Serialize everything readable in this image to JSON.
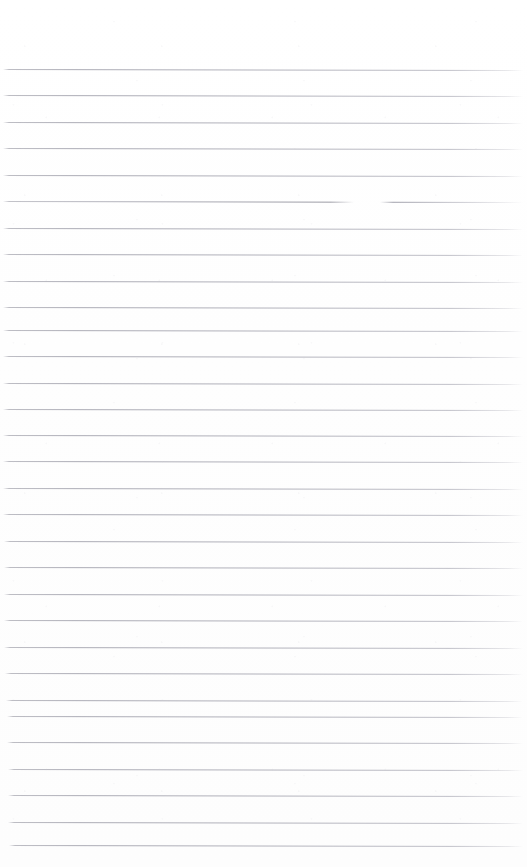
{
  "document": {
    "kind": "scanned-blank-ruled-page",
    "title": "Blank Ruled Notebook Page",
    "page_width": 527,
    "page_height": 867,
    "background_color": "#ffffff",
    "rule_color": "#aaaab4",
    "has_visible_text": false,
    "has_handwriting": false,
    "has_margin_rule": false,
    "top_margin_height": 68,
    "rule_spacing": 26.5,
    "rule_thickness": 1,
    "rule_left_x": 4,
    "rule_right_x": 523,
    "rule_slope_deg": 0.12,
    "rule_count": 30,
    "notes": "Empty lined paper scan: no writing, no headers, no page numbers."
  },
  "rules": [
    {
      "index": 1,
      "y": 69,
      "left": 3,
      "right": 523,
      "gap": false
    },
    {
      "index": 2,
      "y": 95,
      "left": 3,
      "right": 523,
      "gap": false
    },
    {
      "index": 3,
      "y": 122,
      "left": 3,
      "right": 523,
      "gap": false
    },
    {
      "index": 4,
      "y": 148,
      "left": 3,
      "right": 523,
      "gap": false
    },
    {
      "index": 5,
      "y": 175,
      "left": 3,
      "right": 523,
      "gap": false
    },
    {
      "index": 6,
      "y": 201,
      "left": 3,
      "right": 523,
      "gap": true
    },
    {
      "index": 7,
      "y": 228,
      "left": 3,
      "right": 523,
      "gap": false
    },
    {
      "index": 8,
      "y": 254,
      "left": 3,
      "right": 523,
      "gap": false
    },
    {
      "index": 9,
      "y": 281,
      "left": 3,
      "right": 523,
      "gap": false
    },
    {
      "index": 10,
      "y": 307,
      "left": 3,
      "right": 523,
      "gap": false
    },
    {
      "index": 11,
      "y": 330,
      "left": 3,
      "right": 523,
      "gap": false
    },
    {
      "index": 12,
      "y": 356,
      "left": 3,
      "right": 523,
      "gap": false
    },
    {
      "index": 13,
      "y": 383,
      "left": 3,
      "right": 523,
      "gap": false
    },
    {
      "index": 14,
      "y": 409,
      "left": 3,
      "right": 523,
      "gap": false
    },
    {
      "index": 15,
      "y": 435,
      "left": 3,
      "right": 523,
      "gap": false
    },
    {
      "index": 16,
      "y": 461,
      "left": 3,
      "right": 523,
      "gap": false
    },
    {
      "index": 17,
      "y": 488,
      "left": 3,
      "right": 523,
      "gap": false
    },
    {
      "index": 18,
      "y": 514,
      "left": 3,
      "right": 523,
      "gap": false
    },
    {
      "index": 19,
      "y": 541,
      "left": 4,
      "right": 523,
      "gap": false
    },
    {
      "index": 20,
      "y": 567,
      "left": 4,
      "right": 523,
      "gap": false
    },
    {
      "index": 21,
      "y": 594,
      "left": 4,
      "right": 523,
      "gap": false
    },
    {
      "index": 22,
      "y": 620,
      "left": 4,
      "right": 523,
      "gap": false
    },
    {
      "index": 23,
      "y": 647,
      "left": 4,
      "right": 523,
      "gap": false
    },
    {
      "index": 24,
      "y": 673,
      "left": 5,
      "right": 523,
      "gap": false
    },
    {
      "index": 25,
      "y": 700,
      "left": 6,
      "right": 523,
      "gap": false
    },
    {
      "index": 26,
      "y": 716,
      "left": 7,
      "right": 523,
      "gap": false
    },
    {
      "index": 27,
      "y": 742,
      "left": 7,
      "right": 523,
      "gap": false
    },
    {
      "index": 28,
      "y": 769,
      "left": 8,
      "right": 523,
      "gap": false
    },
    {
      "index": 29,
      "y": 795,
      "left": 8,
      "right": 523,
      "gap": false
    },
    {
      "index": 30,
      "y": 822,
      "left": 8,
      "right": 523,
      "gap": false
    },
    {
      "index": 31,
      "y": 845,
      "left": 9,
      "right": 523,
      "gap": false
    }
  ]
}
